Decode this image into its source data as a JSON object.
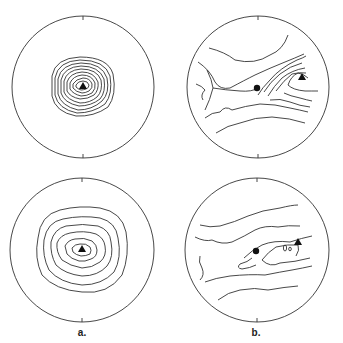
{
  "figure": {
    "panels": [
      {
        "id": "a-top",
        "column": "a",
        "row": 1,
        "description": "concentric closed contours around a triangle marker, tightly spaced"
      },
      {
        "id": "b-top",
        "column": "b",
        "row": 1,
        "description": "open contours converging toward triangle marker on right, with a dot marker near center"
      },
      {
        "id": "a-bottom",
        "column": "a",
        "row": 2,
        "description": "concentric closed contours around a triangle marker, widely spaced"
      },
      {
        "id": "b-bottom",
        "column": "b",
        "row": 2,
        "description": "open contours with dot and triangle markers, small closed loops near triangle"
      }
    ],
    "labels": {
      "a": "a.",
      "b": "b."
    },
    "markers": {
      "triangle": "triangle-marker",
      "dot": "dot-marker"
    },
    "colors": {
      "line": "#333333",
      "background": "#ffffff"
    }
  }
}
